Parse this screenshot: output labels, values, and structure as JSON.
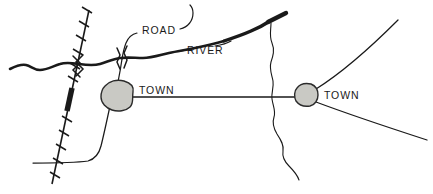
{
  "map": {
    "title": "Sketch map of road, river, railroad and two towns",
    "width": 433,
    "height": 194,
    "background_color": "#ffffff",
    "ink_color": "#1a1a1a",
    "town_fill_color": "#c9c9c4",
    "town_stroke_color": "#2b2b2b",
    "labels": {
      "road": "ROAD",
      "river": "RIVER",
      "town_left": "TOWN",
      "town_right": "TOWN"
    },
    "features": [
      {
        "name": "river",
        "label": "RIVER",
        "style": "thick-wavy-line",
        "color": "#1a1a1a",
        "description": "Main river entering from left edge, running east, forking up to the top right"
      },
      {
        "name": "tributary",
        "label": "",
        "style": "thin-wavy-line",
        "color": "#1a1a1a",
        "description": "Thin wavy tributary branching south from the river fork"
      },
      {
        "name": "road",
        "label": "ROAD",
        "style": "thin-line",
        "color": "#1a1a1a",
        "description": "Road network linking the two towns and radiating to the edges"
      },
      {
        "name": "railroad",
        "label": "",
        "style": "tick-marked-line",
        "color": "#1a1a1a",
        "description": "Railroad running diagonally from top to bottom left with cross ties and a solid black tunnel segment"
      },
      {
        "name": "bridge",
        "label": "",
        "style": "hatch-marks",
        "color": "#1a1a1a",
        "description": "Bridge symbols where road and railroad cross the river"
      }
    ],
    "towns": [
      {
        "name": "town-left",
        "label": "TOWN",
        "cx": 117,
        "cy": 95,
        "rx": 16,
        "ry": 13
      },
      {
        "name": "town-right",
        "label": "TOWN",
        "cx": 306,
        "cy": 95,
        "rx": 12,
        "ry": 11
      }
    ]
  }
}
